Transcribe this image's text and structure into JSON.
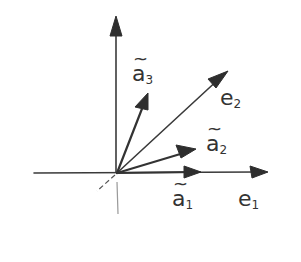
{
  "diagram": {
    "type": "vector-basis-sketch",
    "colors": {
      "ink": "#333333",
      "background": "#ffffff"
    },
    "origin": {
      "x": 117,
      "y": 173
    },
    "axes": [
      {
        "id": "vertical-axis",
        "from": [
          116,
          215
        ],
        "to": [
          116,
          17
        ]
      },
      {
        "id": "horizontal-axis",
        "from": [
          34,
          173
        ],
        "to": [
          268,
          172
        ]
      },
      {
        "id": "depth-axis-dashed",
        "from": [
          117,
          173
        ],
        "to": [
          97,
          191
        ]
      }
    ],
    "vectors": [
      {
        "id": "e1",
        "to": [
          268,
          172
        ]
      },
      {
        "id": "e2",
        "to": [
          227,
          72
        ]
      },
      {
        "id": "a1_tilde",
        "to": [
          201,
          172
        ]
      },
      {
        "id": "a2_tilde",
        "to": [
          195,
          150
        ]
      },
      {
        "id": "a3_tilde",
        "to": [
          148,
          93
        ]
      }
    ],
    "labels": {
      "a3": {
        "base": "a",
        "tilde": "~",
        "sub": "3"
      },
      "e2": {
        "base": "e",
        "sub": "2"
      },
      "a2": {
        "base": "a",
        "tilde": "~",
        "sub": "2"
      },
      "a1": {
        "base": "a",
        "tilde": "~",
        "sub": "1"
      },
      "e1": {
        "base": "e",
        "sub": "1"
      }
    }
  }
}
